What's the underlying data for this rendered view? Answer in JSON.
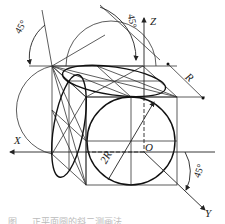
{
  "figure": {
    "axes": {
      "x_label": "X",
      "y_label": "Y",
      "z_label": "Z",
      "origin_label": "O"
    },
    "dimensions": {
      "radius_label": "R",
      "diameter_label": "2R"
    },
    "angles": {
      "top_left": "45°",
      "top_right": "45°",
      "bottom_right": "45°"
    },
    "caption": "图 … 正平面圆的斜二测画法"
  }
}
